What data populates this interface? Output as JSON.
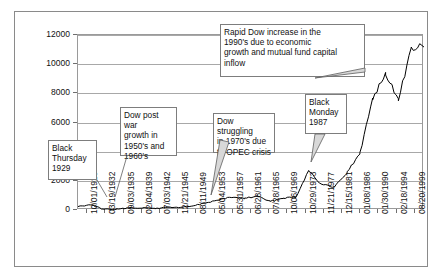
{
  "chart_data": {
    "type": "line",
    "title": "",
    "xlabel": "",
    "ylabel": "",
    "ylim": [
      0,
      12000
    ],
    "ytick_step": 2000,
    "grid": true,
    "legend": "none",
    "line_color": "#000000",
    "border_color": "#8a8a8a",
    "gridline_color": "#a8a8a8",
    "ytick_labels": [
      "12000",
      "10000",
      "8000",
      "6000",
      "4000",
      "2000",
      "0"
    ],
    "ytick_values": [
      12000,
      10000,
      8000,
      6000,
      4000,
      2000,
      0
    ],
    "categories": [
      "10/01/1928",
      "03/19/1932",
      "09/03/1935",
      "02/04/1939",
      "07/03/1942",
      "12/21/1945",
      "08/11/1949",
      "05/04/1953",
      "05/31/1957",
      "06/28/1961",
      "07/28/1965",
      "10/06/1969",
      "10/29/1973",
      "11/21/1977",
      "12/15/1981",
      "01/08/1986",
      "01/30/1990",
      "02/18/1994",
      "08/20/1999"
    ],
    "series": [
      {
        "name": "Dow Jones Industrial Average",
        "x": [
          "10/01/1928",
          "1929-09",
          "1932-07",
          "03/19/1932",
          "09/03/1935",
          "02/04/1939",
          "07/03/1942",
          "12/21/1945",
          "08/11/1949",
          "05/04/1953",
          "05/31/1957",
          "06/28/1961",
          "07/28/1965",
          "10/06/1969",
          "10/29/1973",
          "1974-12",
          "11/21/1977",
          "12/15/1981",
          "1987-08",
          "1987-10",
          "01/08/1986",
          "01/30/1990",
          "02/18/1994",
          "1997-06",
          "1998-07",
          "1998-09",
          "08/20/1999",
          "1999-12"
        ],
        "values": [
          240,
          381,
          41,
          60,
          140,
          145,
          100,
          192,
          180,
          275,
          500,
          690,
          880,
          800,
          950,
          580,
          830,
          880,
          2722,
          1739,
          1570,
          2590,
          3870,
          7700,
          9300,
          7600,
          11000,
          11300
        ]
      }
    ],
    "annotations": [
      {
        "id": "black-thursday",
        "text": "Black Thursday 1929",
        "lines": [
          "Black",
          "Thursday",
          "1929"
        ]
      },
      {
        "id": "post-war-growth",
        "text": "Dow post war growth in 1950's and 1960's",
        "lines": [
          "Dow post war",
          "growth in",
          "1950's and",
          "1960's"
        ]
      },
      {
        "id": "opec-crisis",
        "text": "Dow struggling in 1970's due to OPEC crisis",
        "lines": [
          "Dow struggling",
          "in 1970's  due",
          "to OPEC crisis"
        ]
      },
      {
        "id": "black-monday",
        "text": "Black Monday 1987",
        "lines": [
          "Black",
          "Monday",
          "1987"
        ]
      },
      {
        "id": "rapid-increase",
        "text": "Rapid Dow increase in the 1990's due to economic growth and mutual fund capital inflow",
        "lines": [
          "Rapid Dow increase in the",
          "1990's due to economic",
          "growth and mutual fund capital",
          "inflow"
        ]
      }
    ]
  }
}
